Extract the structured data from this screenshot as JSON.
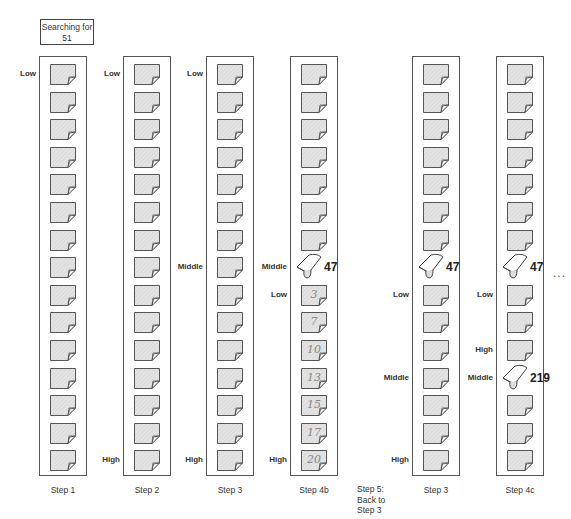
{
  "title_box": {
    "line1": "Searching for",
    "line2": "51"
  },
  "layout": {
    "card_top": 64,
    "card_pitch": 27.6,
    "card_count": 15
  },
  "colors": {
    "card_fill": "#e4e4e4",
    "card_stroke": "#555555",
    "border": "#555555"
  },
  "columns": [
    {
      "id": "step1",
      "left": 39,
      "caption": "Step 1",
      "labels": [
        {
          "index": 0,
          "text": "Low"
        }
      ],
      "flipped": [],
      "handwritten": []
    },
    {
      "id": "step2",
      "left": 123,
      "caption": "Step 2",
      "labels": [
        {
          "index": 0,
          "text": "Low"
        },
        {
          "index": 14,
          "text": "High"
        }
      ],
      "flipped": [],
      "handwritten": []
    },
    {
      "id": "step3a",
      "left": 206,
      "caption": "Step 3",
      "labels": [
        {
          "index": 0,
          "text": "Low"
        },
        {
          "index": 7,
          "text": "Middle"
        },
        {
          "index": 14,
          "text": "High"
        }
      ],
      "flipped": [],
      "handwritten": []
    },
    {
      "id": "step4b",
      "left": 290,
      "caption": "Step 4b",
      "labels": [
        {
          "index": 7,
          "text": "Middle"
        },
        {
          "index": 8,
          "text": "Low"
        },
        {
          "index": 14,
          "text": "High"
        }
      ],
      "flipped": [
        {
          "index": 7,
          "value": "47"
        }
      ],
      "handwritten": [
        {
          "index": 8,
          "value": "3"
        },
        {
          "index": 9,
          "value": "7"
        },
        {
          "index": 10,
          "value": "10"
        },
        {
          "index": 11,
          "value": "13"
        },
        {
          "index": 12,
          "value": "15"
        },
        {
          "index": 13,
          "value": "17"
        },
        {
          "index": 14,
          "value": "20"
        }
      ]
    },
    {
      "id": "step3b",
      "left": 412,
      "caption": "Step 3",
      "labels": [
        {
          "index": 8,
          "text": "Low"
        },
        {
          "index": 11,
          "text": "Middle"
        },
        {
          "index": 14,
          "text": "High"
        }
      ],
      "flipped": [
        {
          "index": 7,
          "value": "47"
        }
      ],
      "handwritten": []
    },
    {
      "id": "step4c",
      "left": 496,
      "caption": "Step 4c",
      "labels": [
        {
          "index": 8,
          "text": "Low"
        },
        {
          "index": 10,
          "text": "High"
        },
        {
          "index": 11,
          "text": "Middle"
        }
      ],
      "flipped": [
        {
          "index": 7,
          "value": "47"
        },
        {
          "index": 11,
          "value": "219"
        }
      ],
      "handwritten": []
    }
  ],
  "step5_note": {
    "line1": "Step 5:",
    "line2": "Back to",
    "line3": "Step 3"
  },
  "continuation": "..."
}
